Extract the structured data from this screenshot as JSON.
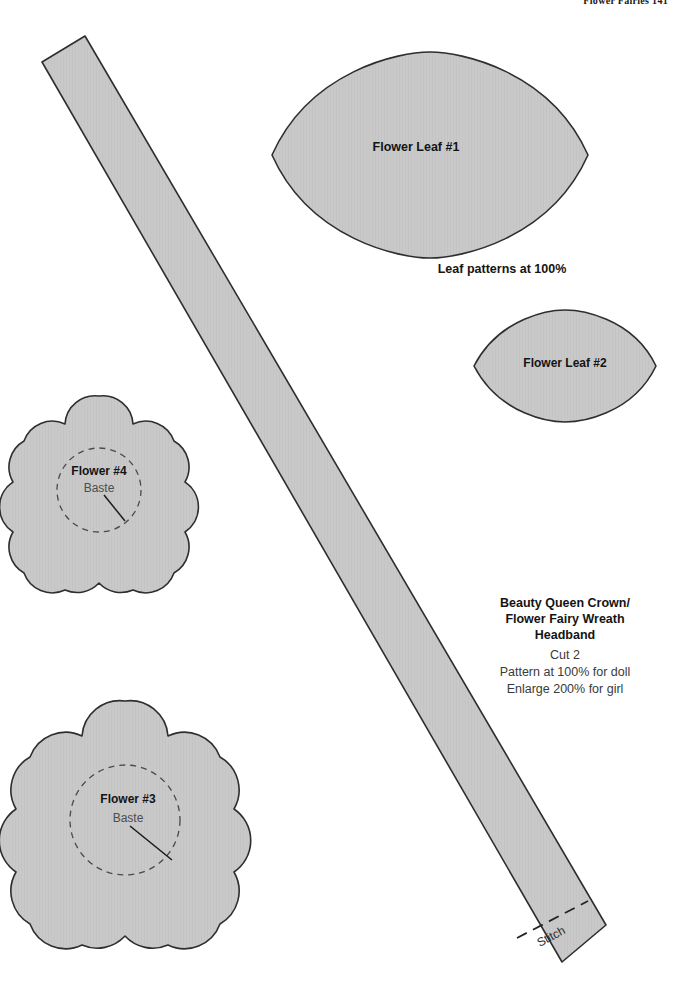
{
  "page": {
    "header": "Flower Fairies  141",
    "width": 676,
    "height": 992,
    "background": "#ffffff"
  },
  "style": {
    "piece_fill": "#c9c9c9",
    "piece_stroke": "#2e2e2e",
    "dashed_stroke": "#4a4a4a",
    "text_dark": "#141414",
    "text_gray": "#4d4d4d"
  },
  "pieces": {
    "leaf1": {
      "label": "Flower Leaf #1",
      "name": "flower-leaf-1"
    },
    "leaf2": {
      "label": "Flower Leaf #2",
      "name": "flower-leaf-2"
    },
    "leaf_caption": "Leaf patterns at 100%",
    "flower4": {
      "label": "Flower #4",
      "sublabel": "Baste"
    },
    "flower3": {
      "label": "Flower #3",
      "sublabel": "Baste"
    },
    "headband": {
      "title_line1": "Beauty Queen Crown/",
      "title_line2": "Flower Fairy Wreath",
      "title_line3": "Headband",
      "cut": "Cut 2",
      "note1": "Pattern at 100% for doll",
      "note2": "Enlarge 200% for girl",
      "stitch_label": "Stitch"
    }
  }
}
